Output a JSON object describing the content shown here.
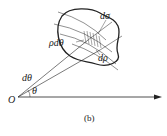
{
  "figure": {
    "caption": "(b)",
    "labels": {
      "origin": "O",
      "theta": "θ",
      "dtheta": "dθ",
      "rho_dtheta": "ρdθ",
      "dsigma": "dσ",
      "drho": "dρ"
    },
    "colors": {
      "stroke": "#222222",
      "background": "#ffffff"
    }
  }
}
